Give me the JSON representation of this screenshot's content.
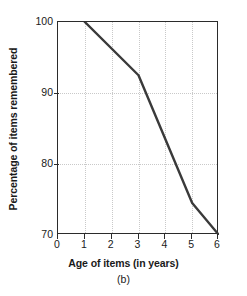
{
  "figure": {
    "caption": "(b)",
    "line_color": "#3a3a3a",
    "axis_color": "#2b2b2b",
    "grid_color": "#c9c9c9",
    "background": "#ffffff"
  },
  "chart_data": {
    "type": "line",
    "title": "",
    "xlabel": "Age of items (in years)",
    "ylabel": "Percentage of items remembered",
    "xlim": [
      0,
      6
    ],
    "ylim": [
      70,
      100
    ],
    "xticks": [
      0,
      1,
      2,
      3,
      4,
      5,
      6
    ],
    "xtick_labels": [
      "0",
      "1",
      "2",
      "3",
      "4",
      "5",
      "6"
    ],
    "yticks": [
      70,
      80,
      90,
      100
    ],
    "ytick_labels": [
      "70",
      "80",
      "90",
      "100"
    ],
    "grid": "dotted light gray, vertical at x=1..5 and horizontal at y=80,90",
    "legend": null,
    "series": [
      {
        "name": "Percentage of items remembered",
        "x": [
          1,
          3,
          5,
          6
        ],
        "values": [
          100,
          92.5,
          74.5,
          70
        ]
      }
    ]
  }
}
